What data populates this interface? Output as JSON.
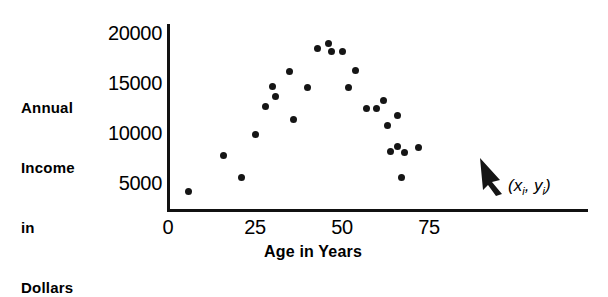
{
  "figure": {
    "kind": "scatter-plot",
    "ink_color": "#151515"
  },
  "annotation": {
    "open_paren": "(",
    "x_symbol": "x",
    "x_sub": "i",
    "comma": ", ",
    "y_symbol": "y",
    "y_sub": "i",
    "close_paren": ")",
    "arrow_name": "pointer-arrow"
  },
  "chart_data": {
    "type": "scatter",
    "title": "",
    "xlabel": "Age in Years",
    "ylabel": "Annual Income in Dollars",
    "ylabel_lines": [
      "Annual",
      "Income",
      "in",
      "Dollars"
    ],
    "xlim": [
      0,
      78
    ],
    "ylim": [
      0,
      21500
    ],
    "xticks": [
      0,
      25,
      50,
      75
    ],
    "xtick_labels": [
      "0",
      "25",
      "50",
      "75"
    ],
    "yticks": [
      5000,
      10000,
      15000,
      20000
    ],
    "ytick_labels": [
      "5000",
      "10000",
      "15000",
      "20000"
    ],
    "grid": false,
    "legend": false,
    "points": [
      {
        "x": 6,
        "y": 4200
      },
      {
        "x": 16,
        "y": 7800
      },
      {
        "x": 21,
        "y": 5600
      },
      {
        "x": 25,
        "y": 9900
      },
      {
        "x": 28,
        "y": 12700
      },
      {
        "x": 30,
        "y": 14700
      },
      {
        "x": 31,
        "y": 13700
      },
      {
        "x": 35,
        "y": 16200
      },
      {
        "x": 36,
        "y": 11400
      },
      {
        "x": 40,
        "y": 14600
      },
      {
        "x": 43,
        "y": 18500
      },
      {
        "x": 46,
        "y": 19000
      },
      {
        "x": 47,
        "y": 18200
      },
      {
        "x": 50,
        "y": 18200
      },
      {
        "x": 52,
        "y": 14600
      },
      {
        "x": 54,
        "y": 16300
      },
      {
        "x": 57,
        "y": 12500
      },
      {
        "x": 60,
        "y": 12500
      },
      {
        "x": 62,
        "y": 13300
      },
      {
        "x": 63,
        "y": 10800
      },
      {
        "x": 66,
        "y": 11800
      },
      {
        "x": 64,
        "y": 8200
      },
      {
        "x": 66,
        "y": 8700
      },
      {
        "x": 68,
        "y": 8100
      },
      {
        "x": 72,
        "y": 8600
      },
      {
        "x": 67,
        "y": 5600
      }
    ]
  }
}
